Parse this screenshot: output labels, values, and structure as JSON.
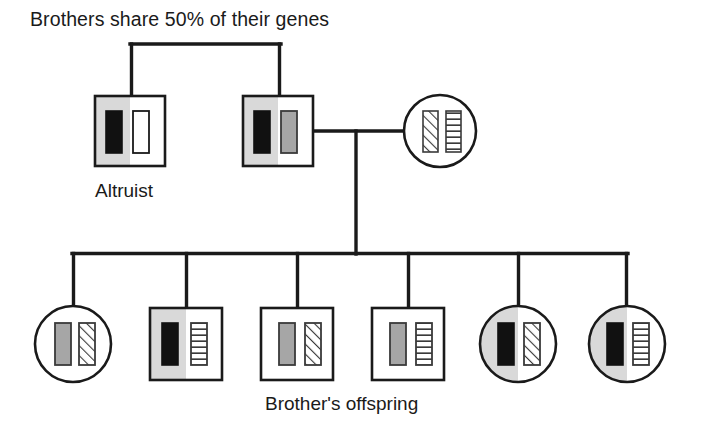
{
  "figure": {
    "type": "pedigree-diagram",
    "title": "Brothers share 50% of their genes",
    "labels": {
      "altruist": "Altruist",
      "offspring": "Brother's offspring"
    },
    "colors": {
      "line": "#1a1a1a",
      "symbol_fill_white": "#ffffff",
      "half_shade_gray": "#d9d9d9",
      "allele_black": "#111111",
      "allele_gray": "#a6a6a6",
      "allele_white": "#ffffff",
      "hatch_stroke": "#3a3a3a",
      "stripe_stroke": "#3a3a3a"
    },
    "allele_patterns": {
      "black": "solid-black-bar",
      "gray": "solid-gray-bar",
      "white": "empty-white-bar",
      "diagonal": "diagonal-hatched-bar",
      "horizontal": "horizontal-striped-bar"
    }
  },
  "generation1": {
    "label": "parental-brothers",
    "individuals": [
      {
        "id": "altruist",
        "shape": "square",
        "sex": "male",
        "caption": "Altruist",
        "left_half_shaded": true,
        "alleles": [
          "black",
          "white"
        ],
        "cx": 130,
        "cy": 131
      },
      {
        "id": "brother",
        "shape": "square",
        "sex": "male",
        "caption": "",
        "left_half_shaded": true,
        "alleles": [
          "black",
          "gray"
        ],
        "cx": 278,
        "cy": 131
      },
      {
        "id": "mate",
        "shape": "circle",
        "sex": "female",
        "caption": "",
        "left_half_shaded": false,
        "alleles": [
          "diagonal",
          "horizontal"
        ],
        "cx": 440,
        "cy": 131
      }
    ],
    "sibship_bar": {
      "x1": 132,
      "x2": 281,
      "y": 44
    },
    "mating_line": {
      "x1": 313,
      "x2": 404,
      "y": 131
    }
  },
  "generation2": {
    "label": "Brother's offspring",
    "descent_line": {
      "x": 355,
      "y1": 131,
      "y2": 253
    },
    "sibship_bar": {
      "x1": 73,
      "x2": 627,
      "y": 253
    },
    "individuals": [
      {
        "id": "offspring-1",
        "shape": "circle",
        "sex": "female",
        "left_half_shaded": false,
        "alleles": [
          "gray",
          "diagonal"
        ],
        "cx": 73,
        "cy": 344
      },
      {
        "id": "offspring-2",
        "shape": "square",
        "sex": "male",
        "left_half_shaded": true,
        "alleles": [
          "black",
          "horizontal"
        ],
        "cx": 186,
        "cy": 344
      },
      {
        "id": "offspring-3",
        "shape": "square",
        "sex": "male",
        "left_half_shaded": false,
        "alleles": [
          "gray",
          "diagonal"
        ],
        "cx": 297,
        "cy": 344
      },
      {
        "id": "offspring-4",
        "shape": "square",
        "sex": "male",
        "left_half_shaded": false,
        "alleles": [
          "gray",
          "horizontal"
        ],
        "cx": 408,
        "cy": 344
      },
      {
        "id": "offspring-5",
        "shape": "circle",
        "sex": "female",
        "left_half_shaded": true,
        "alleles": [
          "black",
          "diagonal"
        ],
        "cx": 518,
        "cy": 344
      },
      {
        "id": "offspring-6",
        "shape": "circle",
        "sex": "female",
        "left_half_shaded": true,
        "alleles": [
          "black",
          "horizontal"
        ],
        "cx": 627,
        "cy": 344
      }
    ]
  }
}
